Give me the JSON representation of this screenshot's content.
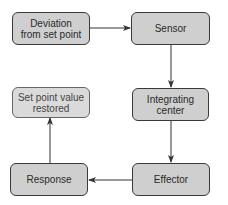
{
  "diagram": {
    "type": "feedback-loop-flowchart",
    "colors": {
      "box_fill": "#cfcfcf",
      "box_border": "#3a3a3a",
      "arrow": "#333333",
      "text": "#2a2a2a"
    },
    "nodes": {
      "deviation": {
        "label": "Deviation from set point"
      },
      "sensor": {
        "label": "Sensor"
      },
      "integrating": {
        "label": "Integrating center"
      },
      "effector": {
        "label": "Effector"
      },
      "response": {
        "label": "Response"
      },
      "restored": {
        "label": "Set point value restored"
      }
    },
    "edges": [
      {
        "from": "deviation",
        "to": "sensor"
      },
      {
        "from": "sensor",
        "to": "integrating"
      },
      {
        "from": "integrating",
        "to": "effector"
      },
      {
        "from": "effector",
        "to": "response"
      },
      {
        "from": "response",
        "to": "restored"
      }
    ]
  }
}
